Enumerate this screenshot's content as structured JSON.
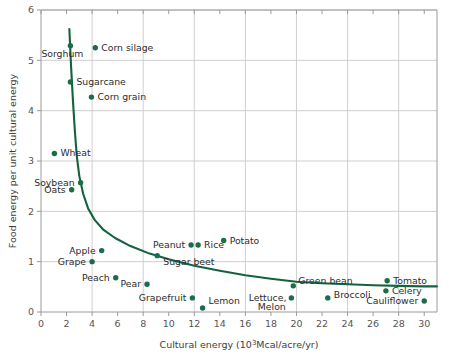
{
  "chart_data": {
    "type": "scatter",
    "title": "",
    "xlabel": "Cultural energy (10³ Mcal/acre/yr)",
    "xlabel_parts": {
      "pre": "Cultural energy (10",
      "sup": "3",
      "post": "Mcal/acre/yr)"
    },
    "ylabel": "Food energy per unit cultural energy",
    "xlim": [
      0,
      31
    ],
    "ylim": [
      0,
      6
    ],
    "xticks": [
      0,
      2,
      4,
      6,
      8,
      10,
      12,
      14,
      16,
      18,
      20,
      22,
      24,
      26,
      28,
      30
    ],
    "yticks": [
      0,
      1,
      2,
      3,
      4,
      5,
      6
    ],
    "xtick_labels": [
      "0",
      "2",
      "4",
      "6",
      "8",
      "10",
      "12",
      "14",
      "16",
      "18",
      "20",
      "22",
      "24",
      "26",
      "28",
      "30"
    ],
    "ytick_labels": [
      "0",
      "1",
      "2",
      "3",
      "4",
      "5",
      "6"
    ],
    "grid": true,
    "grid_color": "#c9c9c9",
    "legend": "none",
    "marker_color": "#1c6b4c",
    "curve_color": "#14623f",
    "points": [
      {
        "name": "Sorghum",
        "x": 2.3,
        "y": 5.29,
        "label_dx": -29,
        "label_dy": 11,
        "anchor": "start"
      },
      {
        "name": "Corn silage",
        "x": 4.25,
        "y": 5.25,
        "label_dx": 6,
        "label_dy": 3,
        "anchor": "start"
      },
      {
        "name": "Sugarcane",
        "x": 2.3,
        "y": 4.57,
        "label_dx": 6,
        "label_dy": 3,
        "anchor": "start"
      },
      {
        "name": "Corn grain",
        "x": 3.95,
        "y": 4.27,
        "label_dx": 6,
        "label_dy": 3,
        "anchor": "start"
      },
      {
        "name": "Wheat",
        "x": 1.05,
        "y": 3.15,
        "label_dx": 6,
        "label_dy": 3,
        "anchor": "start"
      },
      {
        "name": "Soybean",
        "x": 3.1,
        "y": 2.57,
        "label_dx": -6,
        "label_dy": 3,
        "anchor": "end"
      },
      {
        "name": "Oats",
        "x": 2.4,
        "y": 2.43,
        "label_dx": -6,
        "label_dy": 3,
        "anchor": "end"
      },
      {
        "name": "Apple",
        "x": 4.75,
        "y": 1.22,
        "label_dx": -6,
        "label_dy": 3,
        "anchor": "end"
      },
      {
        "name": "Grape",
        "x": 4.0,
        "y": 1.0,
        "label_dx": -6,
        "label_dy": 3,
        "anchor": "end"
      },
      {
        "name": "Peach",
        "x": 5.85,
        "y": 0.68,
        "label_dx": -6,
        "label_dy": 3,
        "anchor": "end"
      },
      {
        "name": "Pear",
        "x": 8.3,
        "y": 0.55,
        "label_dx": -6,
        "label_dy": 3,
        "anchor": "end"
      },
      {
        "name": "Peanut",
        "x": 11.75,
        "y": 1.33,
        "label_dx": -6,
        "label_dy": 3,
        "anchor": "end"
      },
      {
        "name": "Rice",
        "x": 12.3,
        "y": 1.33,
        "label_dx": 6,
        "label_dy": 3,
        "anchor": "start"
      },
      {
        "name": "Potato",
        "x": 14.3,
        "y": 1.42,
        "label_dx": 6,
        "label_dy": 3,
        "anchor": "start"
      },
      {
        "name": "Sugar beet",
        "x": 9.1,
        "y": 1.12,
        "label_dx": 6,
        "label_dy": 9,
        "anchor": "start"
      },
      {
        "name": "Grapefruit",
        "x": 11.85,
        "y": 0.28,
        "label_dx": -6,
        "label_dy": 3,
        "anchor": "end"
      },
      {
        "name": "Lemon",
        "x": 12.65,
        "y": 0.08,
        "label_dx": 6,
        "label_dy": -4,
        "anchor": "start"
      },
      {
        "name": "Green bean",
        "x": 19.75,
        "y": 0.52,
        "label_dx": 5,
        "label_dy": -2,
        "anchor": "start"
      },
      {
        "name": "Lettuce,",
        "x": 19.6,
        "y": 0.28,
        "label_dx": -5,
        "label_dy": 3,
        "anchor": "end"
      },
      {
        "name": "Melon",
        "x": 19.55,
        "y": 0.28,
        "label_dx": -5,
        "label_dy": 12,
        "anchor": "end",
        "no_marker": true
      },
      {
        "name": "Broccoli",
        "x": 22.45,
        "y": 0.28,
        "label_dx": 6,
        "label_dy": 0,
        "anchor": "start"
      },
      {
        "name": "Tomato",
        "x": 27.1,
        "y": 0.62,
        "label_dx": 6,
        "label_dy": 3,
        "anchor": "start"
      },
      {
        "name": "Celery",
        "x": 27.0,
        "y": 0.42,
        "label_dx": 6,
        "label_dy": 3,
        "anchor": "start"
      },
      {
        "name": "Cauliflower",
        "x": 30.0,
        "y": 0.22,
        "label_dx": -6,
        "label_dy": 3,
        "anchor": "end"
      }
    ],
    "curve_description": "Hyperbolic decay fit: food energy falls steeply from ~5.6 near x=2.2 to a plateau near 0.5 at high cultural energy",
    "curve_points": [
      [
        2.22,
        5.62
      ],
      [
        2.35,
        4.9
      ],
      [
        2.5,
        4.2
      ],
      [
        2.65,
        3.6
      ],
      [
        2.8,
        3.1
      ],
      [
        3.0,
        2.7
      ],
      [
        3.3,
        2.35
      ],
      [
        3.7,
        2.05
      ],
      [
        4.2,
        1.83
      ],
      [
        4.9,
        1.63
      ],
      [
        5.8,
        1.47
      ],
      [
        7.0,
        1.31
      ],
      [
        8.5,
        1.16
      ],
      [
        10.0,
        1.05
      ],
      [
        12.0,
        0.92
      ],
      [
        14.0,
        0.82
      ],
      [
        16.0,
        0.73
      ],
      [
        18.0,
        0.66
      ],
      [
        20.0,
        0.6
      ],
      [
        22.0,
        0.57
      ],
      [
        24.0,
        0.55
      ],
      [
        26.0,
        0.53
      ],
      [
        28.0,
        0.52
      ],
      [
        30.0,
        0.51
      ],
      [
        31.0,
        0.51
      ]
    ]
  },
  "caption": ""
}
